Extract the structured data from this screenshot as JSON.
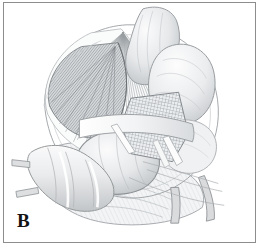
{
  "figure": {
    "panel_label": "B",
    "caption_text": "",
    "alt_description": "Grayscale surgical line-art illustration of abdominal anatomy showing bowel loops, fan-shaped mesentery with radiating vessels, a cross-hatched mesh graft patch, and divided vascular stumps.",
    "style": "pen-and-ink medical illustration, grayscale hatching",
    "frame": {
      "border_color": "#8d8d8d",
      "background_color": "#ffffff"
    },
    "palette": {
      "background": "#ffffff",
      "line": "#7a7d80",
      "line_dark": "#4e5154",
      "fill_light": "#f2f3f4",
      "fill_mid": "#dfe1e3",
      "fill_shadow": "#c3c6c9",
      "fill_deep": "#a6aaad",
      "label_color": "#131313"
    },
    "structures": [
      {
        "name": "mesentery-fan",
        "description": "fan of radiating parallel vessel lines from apex at upper center-left"
      },
      {
        "name": "mesentery-leaf-shaded",
        "description": "dark finely hatched wedge of mesentery, left of center"
      },
      {
        "name": "bowel-loop-upper",
        "description": "smooth shaded bowel limb entering from top"
      },
      {
        "name": "bowel-loop-right",
        "description": "rounded bowel loop, right upper field"
      },
      {
        "name": "bowel-loop-center",
        "description": "large ovoid bowel loop, center lower field"
      },
      {
        "name": "mesh-patch",
        "description": "cross-hatched quadrilateral mesh graft, center right"
      },
      {
        "name": "retractor-band",
        "description": "pale band crossing the mesh patch"
      },
      {
        "name": "duodenum-segment",
        "description": "banded tubular segment, lower left"
      },
      {
        "name": "vessel-stump-left",
        "description": "short divided vessel branch, left margin"
      },
      {
        "name": "vessel-stump-lower-left",
        "description": "short divided vessel branch, lower left"
      },
      {
        "name": "vessel-stump-right-a",
        "description": "divided vessel hanging at lower right"
      },
      {
        "name": "vessel-stump-right-b",
        "description": "second divided vessel at lower right"
      },
      {
        "name": "omental-apron",
        "description": "broad draped tissue across lower field"
      }
    ]
  }
}
